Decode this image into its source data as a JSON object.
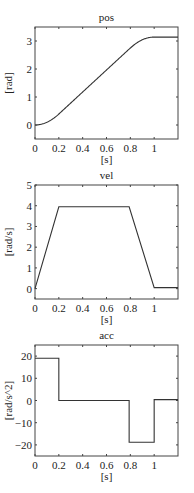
{
  "chart_data": [
    {
      "type": "line",
      "title": "pos",
      "xlabel": "[s]",
      "ylabel": "[rad]",
      "xlim": [
        0,
        1.2
      ],
      "ylim": [
        -0.5,
        3.5
      ],
      "xticks": [
        0,
        0.2,
        0.4,
        0.6,
        0.8,
        1
      ],
      "xtick_labels": [
        "0",
        "0.2",
        "0.4",
        "0.6",
        "0.8",
        "1"
      ],
      "yticks": [
        0,
        1,
        2,
        3
      ],
      "ytick_labels": [
        "0",
        "1",
        "2",
        "3"
      ],
      "grid": false,
      "x": [
        0,
        0.05,
        0.1,
        0.15,
        0.2,
        0.3,
        0.4,
        0.5,
        0.6,
        0.7,
        0.79,
        0.85,
        0.9,
        0.95,
        1.0,
        1.1,
        1.2
      ],
      "y": [
        0,
        0.024,
        0.095,
        0.21,
        0.38,
        0.78,
        1.18,
        1.58,
        1.98,
        2.38,
        2.74,
        2.93,
        3.04,
        3.11,
        3.14,
        3.14,
        3.14
      ]
    },
    {
      "type": "line",
      "title": "vel",
      "xlabel": "[s]",
      "ylabel": "[rad/s]",
      "xlim": [
        0,
        1.2
      ],
      "ylim": [
        -0.5,
        5
      ],
      "xticks": [
        0,
        0.2,
        0.4,
        0.6,
        0.8,
        1
      ],
      "xtick_labels": [
        "0",
        "0.2",
        "0.4",
        "0.6",
        "0.8",
        "1"
      ],
      "yticks": [
        0,
        1,
        2,
        3,
        4,
        5
      ],
      "ytick_labels": [
        "0",
        "1",
        "2",
        "3",
        "4",
        "5"
      ],
      "grid": false,
      "x": [
        0,
        0.2,
        0.79,
        1.0,
        1.2
      ],
      "y": [
        0,
        3.95,
        3.95,
        0.05,
        0.05
      ]
    },
    {
      "type": "line",
      "title": "acc",
      "xlabel": "[s]",
      "ylabel": "[rad/s^2]",
      "xlim": [
        0,
        1.2
      ],
      "ylim": [
        -25,
        25
      ],
      "xticks": [
        0,
        0.2,
        0.4,
        0.6,
        0.8,
        1
      ],
      "xtick_labels": [
        "0",
        "0.2",
        "0.4",
        "0.6",
        "0.8",
        "1"
      ],
      "yticks": [
        -20,
        -10,
        0,
        10,
        20
      ],
      "ytick_labels": [
        "-20",
        "-10",
        "0",
        "10",
        "20"
      ],
      "grid": false,
      "x": [
        0,
        0.2,
        0.2,
        0.79,
        0.79,
        1.0,
        1.0,
        1.2
      ],
      "y": [
        19,
        19,
        0,
        0,
        -18.8,
        -18.8,
        0.4,
        0.4
      ]
    }
  ],
  "panels": [
    {
      "title": "pos",
      "xlabel": "[s]",
      "ylabel": "[rad]"
    },
    {
      "title": "vel",
      "xlabel": "[s]",
      "ylabel": "[rad/s]"
    },
    {
      "title": "acc",
      "xlabel": "[s]",
      "ylabel": "[rad/s^2]"
    }
  ]
}
